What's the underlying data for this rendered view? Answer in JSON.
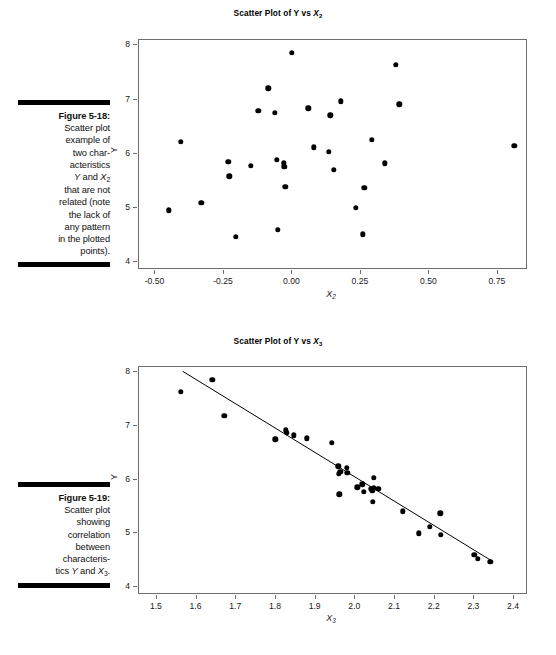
{
  "page": {
    "width": 556,
    "height": 655,
    "background": "#ffffff",
    "ink": "#000000"
  },
  "figures": [
    {
      "id": "figure-5-18",
      "caption_number": "Figure 5-18:",
      "caption_lines": [
        "Scatter plot",
        "example of",
        "two char-",
        "acteristics",
        "Y and X2",
        "that are not",
        "related (note",
        "the lack of",
        "any pattern",
        "in the plotted",
        "points)."
      ],
      "caption_full": "Figure 5-18: Scatter plot example of two characteristics Y and X2 that are not related (note the lack of any pattern in the plotted points)."
    },
    {
      "id": "figure-5-19",
      "caption_number": "Figure 5-19:",
      "caption_lines": [
        "Scatter plot",
        "showing",
        "correlation",
        "between",
        "characteris-",
        "tics Y and X3."
      ],
      "caption_full": "Figure 5-19: Scatter plot showing correlation between characteristics Y and X3."
    }
  ],
  "chart_data": [
    {
      "type": "scatter",
      "id": "scatter-y-vs-x2",
      "title": "Scatter Plot of Y vs X₂",
      "title_plain": "Scatter Plot of Y vs X2",
      "xlabel": "X₂",
      "xlabel_plain": "X2",
      "ylabel": "Y",
      "xlim": [
        -0.56,
        0.86
      ],
      "ylim": [
        3.85,
        8.1
      ],
      "xticks": [
        -0.5,
        -0.25,
        0.0,
        0.25,
        0.5,
        0.75
      ],
      "xticklabels": [
        "-0.50",
        "-0.25",
        "0.00",
        "0.25",
        "0.50",
        "0.75"
      ],
      "yticks": [
        4,
        5,
        6,
        7,
        8
      ],
      "yticklabels": [
        "4",
        "5",
        "6",
        "7",
        "8"
      ],
      "grid": false,
      "legend": null,
      "has_fit_line": false,
      "points": [
        [
          -0.452,
          4.95
        ],
        [
          -0.407,
          6.22
        ],
        [
          -0.333,
          5.09
        ],
        [
          -0.234,
          5.85
        ],
        [
          -0.231,
          5.58
        ],
        [
          -0.206,
          4.46
        ],
        [
          -0.152,
          5.78
        ],
        [
          -0.124,
          6.79
        ],
        [
          -0.088,
          7.21
        ],
        [
          -0.065,
          6.76
        ],
        [
          -0.057,
          5.89
        ],
        [
          -0.053,
          4.59
        ],
        [
          -0.031,
          5.82
        ],
        [
          -0.03,
          5.76
        ],
        [
          -0.026,
          5.39
        ],
        [
          -0.002,
          7.86
        ],
        [
          0.058,
          6.84
        ],
        [
          0.077,
          6.12
        ],
        [
          0.132,
          6.03
        ],
        [
          0.139,
          6.71
        ],
        [
          0.151,
          5.7
        ],
        [
          0.177,
          6.97
        ],
        [
          0.231,
          5.0
        ],
        [
          0.258,
          4.51
        ],
        [
          0.262,
          5.37
        ],
        [
          0.289,
          6.26
        ],
        [
          0.337,
          5.82
        ],
        [
          0.378,
          7.64
        ],
        [
          0.39,
          6.91
        ],
        [
          0.81,
          6.15
        ]
      ]
    },
    {
      "type": "scatter",
      "id": "scatter-y-vs-x3",
      "title": "Scatter Plot of Y vs X₃",
      "title_plain": "Scatter Plot of Y vs X3",
      "xlabel": "X₃",
      "xlabel_plain": "X3",
      "ylabel": "Y",
      "xlim": [
        1.455,
        2.435
      ],
      "ylim": [
        3.85,
        8.1
      ],
      "xticks": [
        1.5,
        1.6,
        1.7,
        1.8,
        1.9,
        2.0,
        2.1,
        2.2,
        2.3,
        2.4
      ],
      "xticklabels": [
        "1.5",
        "1.6",
        "1.7",
        "1.8",
        "1.9",
        "2.0",
        "2.1",
        "2.2",
        "2.3",
        "2.4"
      ],
      "yticks": [
        4,
        5,
        6,
        7,
        8
      ],
      "yticklabels": [
        "4",
        "5",
        "6",
        "7",
        "8"
      ],
      "grid": false,
      "legend": null,
      "has_fit_line": true,
      "fit_line": {
        "x0": 1.565,
        "y0": 8.02,
        "x1": 2.345,
        "y1": 4.48
      },
      "points": [
        [
          1.56,
          7.64
        ],
        [
          1.64,
          7.86
        ],
        [
          1.67,
          7.19
        ],
        [
          1.798,
          6.75
        ],
        [
          1.825,
          6.92
        ],
        [
          1.828,
          6.87
        ],
        [
          1.845,
          6.83
        ],
        [
          1.877,
          6.77
        ],
        [
          1.94,
          6.69
        ],
        [
          1.957,
          6.25
        ],
        [
          1.958,
          6.11
        ],
        [
          1.962,
          6.15
        ],
        [
          1.96,
          5.73
        ],
        [
          1.978,
          6.22
        ],
        [
          1.98,
          6.13
        ],
        [
          2.005,
          5.86
        ],
        [
          2.018,
          5.91
        ],
        [
          2.022,
          5.77
        ],
        [
          2.04,
          5.83
        ],
        [
          2.043,
          5.8
        ],
        [
          2.046,
          5.85
        ],
        [
          2.047,
          6.03
        ],
        [
          2.044,
          5.59
        ],
        [
          2.058,
          5.83
        ],
        [
          2.12,
          5.41
        ],
        [
          2.16,
          5.0
        ],
        [
          2.188,
          5.12
        ],
        [
          2.214,
          5.37
        ],
        [
          2.216,
          4.97
        ],
        [
          2.3,
          4.6
        ],
        [
          2.308,
          4.52
        ],
        [
          2.34,
          4.47
        ]
      ]
    }
  ]
}
